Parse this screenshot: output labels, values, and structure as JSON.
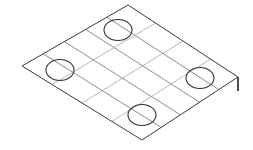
{
  "figure": {
    "type": "technical-line-drawing",
    "canvas": {
      "width": 253,
      "height": 150,
      "background": "#ffffff"
    },
    "stroke_colors": {
      "outline": "#3a3a3a",
      "grid": "#6e6e6e",
      "grid_faint": "#9a9a9a",
      "hole": "#2e2e2e"
    }
  },
  "plate": {
    "name": "grid-plate",
    "corners": {
      "left": {
        "x": 22,
        "y": 66
      },
      "top": {
        "x": 128,
        "y": 5
      },
      "right": {
        "x": 238,
        "y": 77
      },
      "bottom": {
        "x": 142,
        "y": 140
      }
    },
    "outline_path": "M22,66 L128,5 L238,77 L142,140 Z",
    "thickness_edge": {
      "x1": 238,
      "y1": 77,
      "x2": 238,
      "y2": 91
    },
    "grid": {
      "divisions_u": 5,
      "divisions_v": 4,
      "u_lines": [
        "M43.2,53.8 L165.2,127.0",
        "M64.4,41.6 L188.4,114.0",
        "M85.6,29.4 L211.6,101.0",
        "M106.8,17.2 L234.8,88.0"
      ],
      "v_lines": [
        "M49.0,82.5 L155.0,21.5",
        "M76.0,99.0 L182.0,38.0",
        "M103.0,115.5 L209.0,54.5",
        "M130.0,132.0 L236.0,71.0"
      ]
    },
    "holes": [
      {
        "id": "hole-top",
        "cx": 118,
        "cy": 30,
        "rx": 14,
        "ry": 10.5
      },
      {
        "id": "hole-left",
        "cx": 60,
        "cy": 70,
        "rx": 14,
        "ry": 10.5
      },
      {
        "id": "hole-right",
        "cx": 200,
        "cy": 78,
        "rx": 14,
        "ry": 10.5
      },
      {
        "id": "hole-bottom",
        "cx": 142,
        "cy": 115,
        "rx": 14,
        "ry": 10.5
      }
    ]
  },
  "labels": {
    "caption": ""
  }
}
